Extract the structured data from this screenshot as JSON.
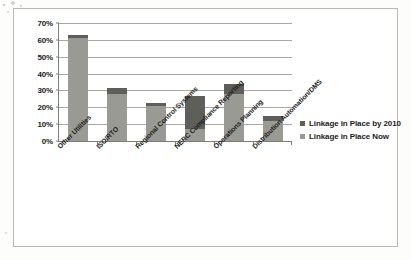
{
  "chart_data": {
    "type": "bar",
    "subtype": "stacked-vertical",
    "title": "",
    "xlabel": "",
    "ylabel": "",
    "ylim": [
      0,
      70
    ],
    "ytick_step": 10,
    "ytick_labels": [
      "70%",
      "60%",
      "50%",
      "40%",
      "30%",
      "20%",
      "10%",
      "0%"
    ],
    "ytick_values": [
      70,
      60,
      50,
      40,
      30,
      20,
      10,
      0
    ],
    "grid": true,
    "grid_axis": "y",
    "legend_position": "right",
    "categories": [
      "Other Utilities",
      "ISO/RTO",
      "Regional Control Systems",
      "NERC Compliance Reporting",
      "Operations Planning",
      "Distribution Automation/DMS"
    ],
    "series": [
      {
        "name": "Linkage in Place Now",
        "color": "#9a9a95",
        "values": [
          61,
          28,
          20.5,
          7,
          28,
          12
        ]
      },
      {
        "name": "Linkage in Place by 2010",
        "color": "#5e5e5a",
        "values": [
          2,
          3.5,
          2,
          19.5,
          6,
          3
        ]
      }
    ],
    "totals": [
      63,
      31.5,
      22.5,
      26.5,
      34,
      15
    ]
  },
  "legend": {
    "items": [
      {
        "label": "Linkage in Place by 2010",
        "color": "#5e5e5a"
      },
      {
        "label": "Linkage in Place Now",
        "color": "#9a9a95"
      }
    ]
  }
}
